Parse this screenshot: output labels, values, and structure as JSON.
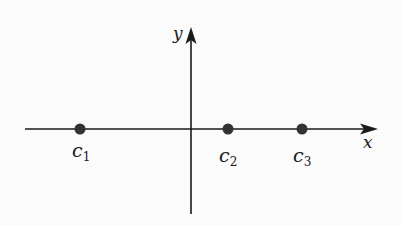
{
  "diagram": {
    "type": "number-line-axes",
    "axes": {
      "x_label": "x",
      "y_label": "y"
    },
    "points": [
      {
        "name": "c",
        "subscript": "1",
        "x": 80
      },
      {
        "name": "c",
        "subscript": "2",
        "x": 228
      },
      {
        "name": "c",
        "subscript": "3",
        "x": 302
      }
    ],
    "colors": {
      "ink": "#1a1a1a",
      "point": "#333333",
      "background": "#fbfbfb"
    }
  }
}
